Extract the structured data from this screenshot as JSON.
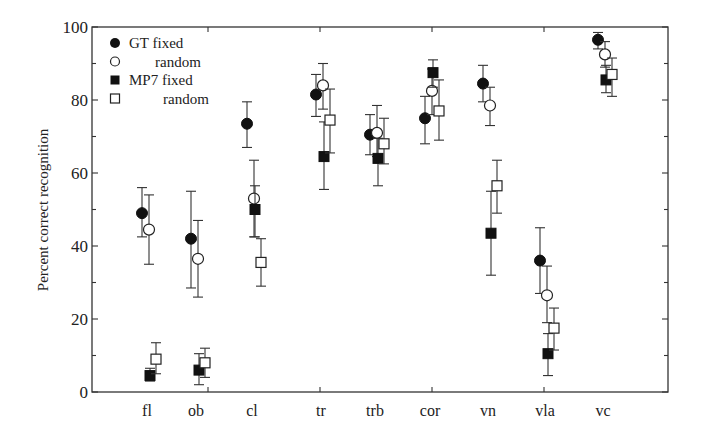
{
  "chart_data": {
    "type": "scatter",
    "title": "",
    "xlabel": "",
    "ylabel": "Percent correct recognition",
    "ylim": [
      0,
      100
    ],
    "yticks": [
      0,
      20,
      40,
      60,
      80,
      100
    ],
    "grid": false,
    "legend_position": "upper-left",
    "categories": [
      "fl",
      "ob",
      "cl",
      "tr",
      "trb",
      "cor",
      "vn",
      "vla",
      "vc"
    ],
    "series": [
      {
        "name": "GT fixed",
        "legend_label": "GT fixed",
        "marker": "filled-circle",
        "values": [
          49,
          42,
          73.5,
          81.5,
          70.5,
          75,
          84.5,
          36,
          96.5
        ],
        "err_low": [
          42.5,
          28.5,
          67,
          75.5,
          65,
          68,
          79.5,
          27,
          94
        ],
        "err_high": [
          56,
          55,
          79.5,
          87,
          76,
          81,
          89.5,
          45,
          98.5
        ]
      },
      {
        "name": "GT random",
        "legend_label": "random",
        "marker": "open-circle",
        "values": [
          44.5,
          36.5,
          53,
          84,
          71,
          82.5,
          78.5,
          26.5,
          92.5
        ],
        "err_low": [
          35,
          26,
          42.5,
          77.5,
          64.5,
          76,
          73,
          19,
          89
        ],
        "err_high": [
          54,
          47,
          63.5,
          90,
          78.5,
          88.5,
          83.5,
          34.5,
          96
        ]
      },
      {
        "name": "MP7 fixed",
        "legend_label": "MP7 fixed",
        "marker": "filled-square",
        "values": [
          4.5,
          6,
          50,
          64.5,
          64,
          87.5,
          43.5,
          10.5,
          85.5
        ],
        "err_low": [
          3,
          2,
          42.5,
          55.5,
          56.5,
          83.5,
          32,
          4.5,
          82
        ],
        "err_high": [
          6.5,
          10.5,
          56.5,
          74,
          69.5,
          91,
          55,
          16,
          89.5
        ]
      },
      {
        "name": "MP7 random",
        "legend_label": "random",
        "marker": "open-square",
        "values": [
          9,
          8,
          35.5,
          74.5,
          68,
          77,
          56.5,
          17.5,
          87
        ],
        "err_low": [
          5,
          4,
          29,
          65.5,
          62.5,
          69,
          49,
          11.5,
          81
        ],
        "err_high": [
          13.5,
          12,
          42,
          83,
          75,
          85.5,
          63.5,
          23,
          91.5
        ]
      }
    ]
  },
  "axis": {
    "ylabel": "Percent correct recognition"
  }
}
